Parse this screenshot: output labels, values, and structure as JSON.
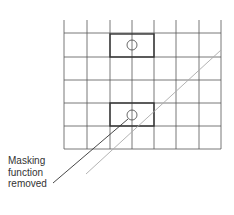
{
  "diagram": {
    "annotation": {
      "lines": [
        "Masking",
        "function",
        "removed"
      ]
    },
    "grid": {
      "x_lines": [
        64,
        87,
        110,
        132,
        154,
        176,
        199,
        221
      ],
      "y_lines": [
        33,
        57,
        80,
        103,
        126,
        149
      ],
      "top_stub_y": 20,
      "color": "#555555"
    },
    "boxes": [
      {
        "name": "upper-box",
        "x": 110,
        "y": 34,
        "w": 44,
        "h": 23
      },
      {
        "name": "lower-box",
        "x": 110,
        "y": 103,
        "w": 44,
        "h": 23
      }
    ],
    "circles": [
      {
        "name": "upper-circle",
        "cx": 132,
        "cy": 45,
        "r": 5
      },
      {
        "name": "lower-circle",
        "cx": 132,
        "cy": 115,
        "r": 5
      }
    ],
    "diagonal_line": {
      "x1": 86,
      "y1": 174,
      "x2": 221,
      "y2": 50,
      "color": "#aaaaaa"
    },
    "leader_line": {
      "x1": 53,
      "y1": 183,
      "x2": 128,
      "y2": 119,
      "color": "#333333"
    }
  }
}
